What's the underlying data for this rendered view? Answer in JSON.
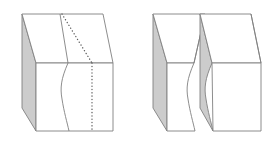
{
  "figure": {
    "title": "Rectangular block with curved fracture surface, shown intact and separated",
    "background_color": "#ffffff",
    "stroke_color": "#808080",
    "stroke_width": 0.9,
    "shaded_face_color": "#cccccc",
    "front_face_color": "#ffffff",
    "top_face_color": "#ffffff",
    "dotted_line_color": "#595959",
    "canvas": {
      "width": 278,
      "height": 143
    },
    "panels": [
      {
        "id": "intact-block",
        "label": "intact-block",
        "description": "Single solid rectangular block with a dotted trace and a curved crack line visible on the front face and top face",
        "shapes": {
          "left_shaded_face": "22,14 22,108 36,131 36,63",
          "top_face": "22,14 103,14 113,63 36,63",
          "front_face": "36,63 113,63 113,131 36,131",
          "crack_curve_top": "60,14 68,63",
          "crack_curve_front": "68,63 62,96 68,131",
          "dotted_curve_top": "62,14 92,63",
          "dotted_curve_front": "92,63 92,131",
          "top_bevel_edge": "103,14 113,63"
        }
      },
      {
        "id": "separated-left-piece",
        "label": "separated-left-piece",
        "description": "Left half of the fractured block with shaded left face and concave fracture face on the right",
        "shapes": {
          "left_shaded_face": "153,14 153,108 167,131 167,63",
          "top_face": "153,14 205,14 194,63 167,63",
          "front_face": "167,63 194,63 190,96 196,131 167,131",
          "fracture_edge_top": "205,14 194,63",
          "fracture_edge_front": "194,63 190,96 196,131"
        }
      },
      {
        "id": "separated-right-piece",
        "label": "separated-right-piece",
        "description": "Right half of the fractured block with shaded convex fracture face on the left",
        "shapes": {
          "left_shaded_face": "200,14 200,108 214,131 217,96 212,63",
          "top_face": "200,14 251,14 261,63 212,63",
          "front_face": "212,63 261,63 261,131 214,131 217,96",
          "top_bevel_edge": "251,14 261,63"
        }
      }
    ]
  }
}
